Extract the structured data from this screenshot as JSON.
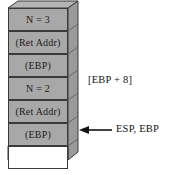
{
  "diagram": {
    "colors": {
      "cell_fill": "#a8a8a8",
      "cell_empty_fill": "#ffffff",
      "border": "#3a3a3a",
      "side_face": "#9a9a9a",
      "top_face": "#b4b4b4",
      "background": "#ffffff",
      "text": "#121212"
    },
    "cells": [
      {
        "label": "N = 3",
        "filled": true
      },
      {
        "label": "(Ret Addr)",
        "filled": true
      },
      {
        "label": "(EBP)",
        "filled": true
      },
      {
        "label": "N = 2",
        "filled": true
      },
      {
        "label": "(Ret Addr)",
        "filled": true
      },
      {
        "label": "(EBP)",
        "filled": true
      },
      {
        "label": "",
        "filled": false
      }
    ],
    "annotations": {
      "offset_label": "[EBP + 8]",
      "pointer_label": "ESP, EBP",
      "pointer_arrow": "left-arrow-icon"
    }
  }
}
